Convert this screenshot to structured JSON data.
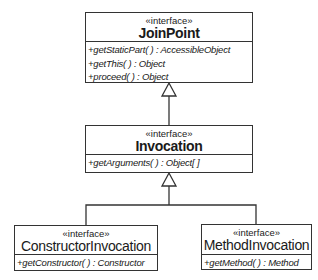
{
  "diagram": {
    "type": "UML class diagram",
    "classes": [
      {
        "id": "joinpoint",
        "stereotype": "«interface»",
        "name": "JoinPoint",
        "operations": [
          "+getStaticPart( ) : AccessibleObject",
          "+getThis( ) : Object",
          "+proceed( ) : Object"
        ]
      },
      {
        "id": "invocation",
        "stereotype": "«interface»",
        "name": "Invocation",
        "operations": [
          "+getArguments( ) : Object[ ]"
        ]
      },
      {
        "id": "constructorinvocation",
        "stereotype": "«interface»",
        "name": "ConstructorInvocation",
        "operations": [
          "+getConstructor( ) : Constructor"
        ]
      },
      {
        "id": "methodinvocation",
        "stereotype": "«interface»",
        "name": "MethodInvocation",
        "operations": [
          "+getMethod( ) : Method"
        ]
      }
    ],
    "relationships": [
      {
        "type": "generalization",
        "from": "Invocation",
        "to": "JoinPoint"
      },
      {
        "type": "generalization",
        "from": "ConstructorInvocation",
        "to": "Invocation"
      },
      {
        "type": "generalization",
        "from": "MethodInvocation",
        "to": "Invocation"
      }
    ]
  }
}
